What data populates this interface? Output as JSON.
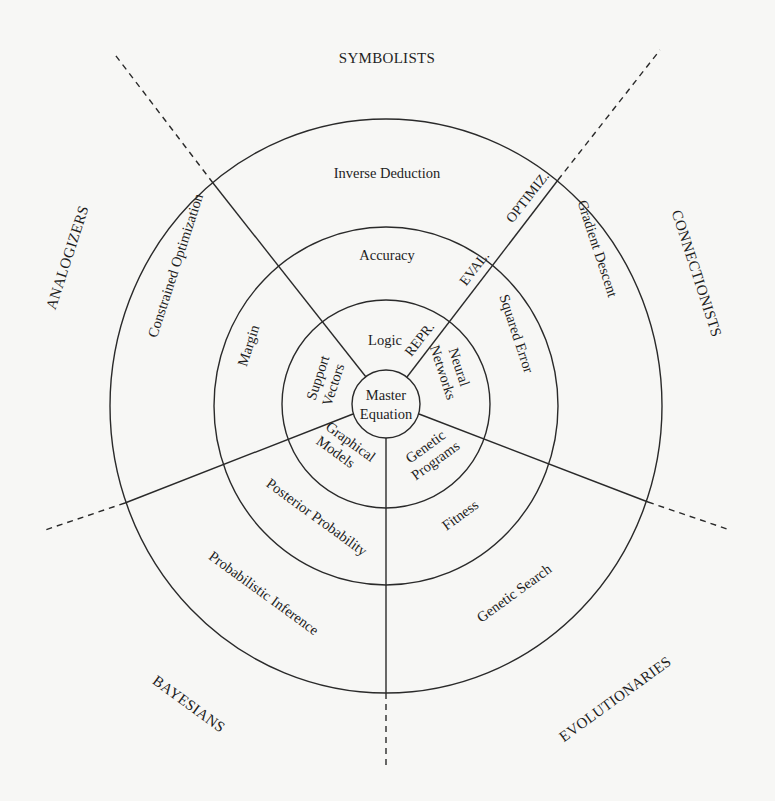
{
  "diagram": {
    "center": {
      "line1": "Master",
      "line2": "Equation"
    },
    "tribes": [
      {
        "name": "SYMBOLISTS"
      },
      {
        "name": "CONNECTIONISTS"
      },
      {
        "name": "EVOLUTIONARIES"
      },
      {
        "name": "BAYESIANS"
      },
      {
        "name": "ANALOGIZERS"
      }
    ],
    "ring_labels": {
      "representation": "REPR.",
      "evaluation": "EVAL.",
      "optimization": "OPTIMIZ."
    },
    "representation": {
      "symbolists": "Logic",
      "connectionists_line1": "Neural",
      "connectionists_line2": "Networks",
      "evolutionaries_line1": "Genetic",
      "evolutionaries_line2": "Programs",
      "bayesians_line1": "Graphical",
      "bayesians_line2": "Models",
      "analogizers_line1": "Support",
      "analogizers_line2": "Vectors"
    },
    "evaluation": {
      "symbolists": "Accuracy",
      "connectionists": "Squared Error",
      "evolutionaries": "Fitness",
      "bayesians": "Posterior Probability",
      "analogizers": "Margin"
    },
    "optimization": {
      "symbolists": "Inverse Deduction",
      "connectionists": "Gradient Descent",
      "evolutionaries": "Genetic Search",
      "bayesians": "Probabilistic Inference",
      "analogizers": "Constrained Optimization"
    }
  }
}
